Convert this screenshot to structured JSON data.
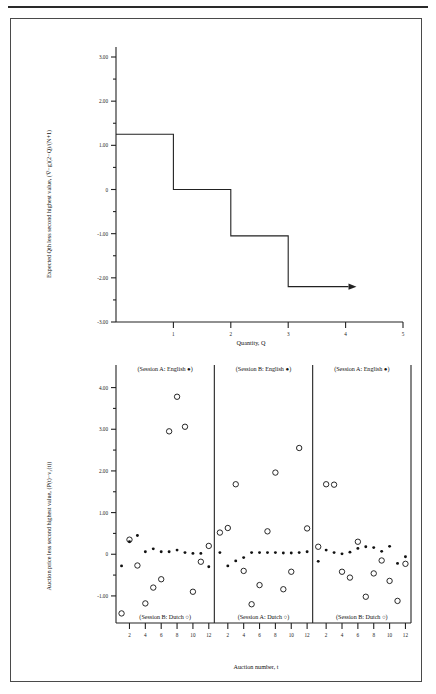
{
  "figure": {
    "background_color": "#ffffff",
    "line_color": "#222222",
    "frame_color": "#4a4a4a"
  },
  "chart_data": [
    {
      "id": "top",
      "type": "line",
      "title": "",
      "xlabel": "Quantity, Q",
      "ylabel": "Expected Qth less second highest value, (V̅−g)(2−Q)/(N+1)",
      "xlim": [
        0,
        5
      ],
      "ylim": [
        -3.0,
        3.0
      ],
      "grid": false,
      "legend": "none",
      "xticks": [
        1,
        2,
        3,
        4,
        5
      ],
      "xticklabels": [
        "1",
        "2",
        "3",
        "4",
        "5"
      ],
      "yticks": [
        3.0,
        2.0,
        1.0,
        0,
        -1.0,
        -2.0,
        -3.0
      ],
      "yticklabels": [
        "3.00",
        "2.00",
        "1.00",
        "0",
        "-1.00",
        "-2.00",
        "-3.00"
      ],
      "step_points": [
        {
          "x": 0,
          "y": 1.25
        },
        {
          "x": 1,
          "y": 1.25
        },
        {
          "x": 1,
          "y": 0
        },
        {
          "x": 2,
          "y": 0
        },
        {
          "x": 2,
          "y": -1.05
        },
        {
          "x": 3,
          "y": -1.05
        },
        {
          "x": 3,
          "y": -2.2
        },
        {
          "x": 4.05,
          "y": -2.2
        }
      ],
      "arrow_at": {
        "x": 4.05,
        "y": -2.2
      }
    },
    {
      "id": "bottom",
      "type": "scatter",
      "title": "",
      "xlabel": "Auction number, t",
      "ylabel": "Auction price less second highest value, (P(t)−v₂(t))",
      "ylim": [
        -1.65,
        4.35
      ],
      "grid": false,
      "yticks": [
        4.0,
        3.0,
        2.0,
        1.0,
        0,
        -1.0
      ],
      "yticklabels": [
        "4.00",
        "3.00",
        "2.00",
        "1.00",
        "0",
        "-1.00"
      ],
      "xticks": [
        2,
        4,
        6,
        8,
        10,
        12
      ],
      "xticklabels": [
        "2",
        "4",
        "6",
        "8",
        "10",
        "12"
      ],
      "panels": [
        {
          "index": 0,
          "top_label": "(Session A: English ●)",
          "bottom_label": "(Session B: Dutch ○)",
          "series": [
            {
              "name": "English",
              "marker": "filled-circle",
              "x": [
                1,
                2,
                3,
                4,
                5,
                6,
                7,
                8,
                9,
                10,
                11,
                12
              ],
              "y": [
                -0.28,
                0.3,
                0.45,
                0.06,
                0.13,
                0.06,
                0.06,
                0.1,
                0.04,
                0.02,
                0.02,
                -0.3
              ]
            },
            {
              "name": "Dutch",
              "marker": "open-circle",
              "x": [
                1,
                2,
                3,
                4,
                5,
                6,
                7,
                8,
                9,
                10,
                11,
                12
              ],
              "y": [
                -1.42,
                0.35,
                -0.27,
                -1.18,
                -0.8,
                -0.6,
                2.95,
                3.78,
                3.06,
                -0.9,
                -0.18,
                0.2
              ]
            }
          ]
        },
        {
          "index": 1,
          "top_label": "(Session B: English ●)",
          "bottom_label": "(Session A: Dutch ○)",
          "series": [
            {
              "name": "English",
              "marker": "filled-circle",
              "x": [
                1,
                2,
                3,
                4,
                5,
                6,
                7,
                8,
                9,
                10,
                11,
                12
              ],
              "y": [
                0.04,
                -0.28,
                -0.16,
                -0.08,
                0.04,
                0.04,
                0.04,
                0.04,
                0.03,
                0.03,
                0.04,
                0.06
              ]
            },
            {
              "name": "Dutch",
              "marker": "open-circle",
              "x": [
                1,
                2,
                3,
                4,
                5,
                6,
                7,
                8,
                9,
                10,
                11,
                12
              ],
              "y": [
                0.52,
                0.63,
                1.68,
                -0.4,
                -1.2,
                -0.74,
                0.55,
                1.96,
                -0.84,
                -0.42,
                2.55,
                0.62
              ]
            }
          ]
        },
        {
          "index": 2,
          "top_label": "(Session A: English ●)",
          "bottom_label": "(Session B: Dutch ○)",
          "series": [
            {
              "name": "English",
              "marker": "filled-circle",
              "x": [
                1,
                2,
                3,
                4,
                5,
                6,
                7,
                8,
                9,
                10,
                11,
                12
              ],
              "y": [
                -0.17,
                0.1,
                0.04,
                0.01,
                0.05,
                0.14,
                0.18,
                0.16,
                0.07,
                0.19,
                -0.22,
                -0.06
              ]
            },
            {
              "name": "Dutch",
              "marker": "open-circle",
              "x": [
                1,
                2,
                3,
                4,
                5,
                6,
                7,
                8,
                9,
                10,
                11,
                12
              ],
              "y": [
                0.18,
                1.68,
                1.67,
                -0.42,
                -0.56,
                0.3,
                -1.02,
                -0.46,
                -0.15,
                -0.64,
                -1.12,
                -0.23
              ]
            }
          ]
        }
      ]
    }
  ]
}
